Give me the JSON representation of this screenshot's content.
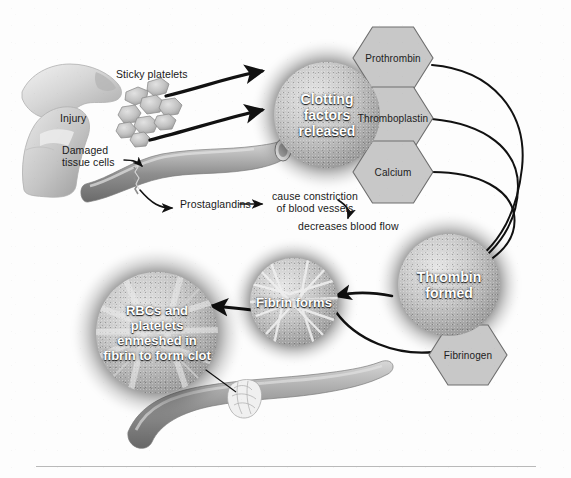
{
  "figure": {
    "type": "biology-process-diagram"
  },
  "labels": {
    "injury": "Injury",
    "sticky_platelets": "Sticky platelets",
    "damaged_tissue_cells": "Damaged\ntissue cells",
    "prostaglandins": "Prostaglandins",
    "cause_constriction": "cause constriction\nof blood vessels",
    "decreases_blood_flow": "decreases blood flow"
  },
  "orbs": [
    {
      "id": "clotting-factors",
      "text": "Clotting\nfactors\nreleased"
    },
    {
      "id": "thrombin-formed",
      "text": "Thrombin\nformed"
    },
    {
      "id": "fibrin-forms",
      "text": "Fibrin\nforms"
    },
    {
      "id": "clot-formed",
      "text": "RBCs and\nplatelets\nenmeshed in\nfibrin to\nform clot"
    }
  ],
  "hexagons": [
    {
      "id": "prothrombin",
      "label": "Prothrombin"
    },
    {
      "id": "thromboplastin",
      "label": "Thromboplastin"
    },
    {
      "id": "calcium",
      "label": "Calcium"
    },
    {
      "id": "fibrinogen",
      "label": "Fibrinogen"
    }
  ],
  "colors": {
    "page_background": "#fdfdfd",
    "hexagon_fill": "#c8c8c8",
    "hexagon_stroke": "#6e6e6e",
    "arrow": "#111111",
    "vessel_light": "#c9c9c9",
    "vessel_mid": "#9a9a9a",
    "vessel_dark": "#6f6f6f",
    "orb_text": "#ffffff",
    "label_text": "#1a1a1a",
    "footer_rule": "#b9b9b9"
  }
}
